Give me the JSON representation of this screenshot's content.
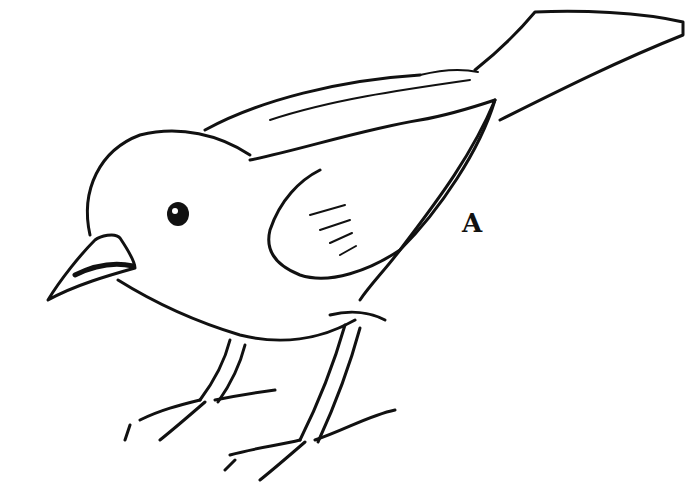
{
  "figure": {
    "label": "A"
  }
}
